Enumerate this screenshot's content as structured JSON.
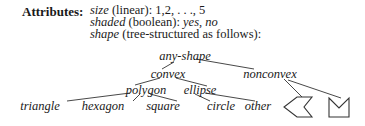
{
  "attributes": {
    "heading": "Attributes:",
    "size": {
      "name": "size",
      "desc": " (linear): 1,2, . . ., 5"
    },
    "shaded": {
      "name": "shaded",
      "desc": " (boolean): ",
      "values": "yes, no"
    },
    "shape": {
      "name": "shape",
      "desc": " (tree-structured as follows):"
    }
  },
  "tree": {
    "root": "any-shape",
    "level1": [
      "convex",
      "nonconvex"
    ],
    "level2": [
      "polygon",
      "ellipse"
    ],
    "leaves": [
      "triangle",
      "hexagon",
      "square",
      "circle",
      "other"
    ],
    "nonconvex_children": [
      "chevron-shape",
      "notched-square-shape"
    ]
  },
  "colors": {
    "text": "#1a1a1a",
    "lines": "#333333"
  }
}
